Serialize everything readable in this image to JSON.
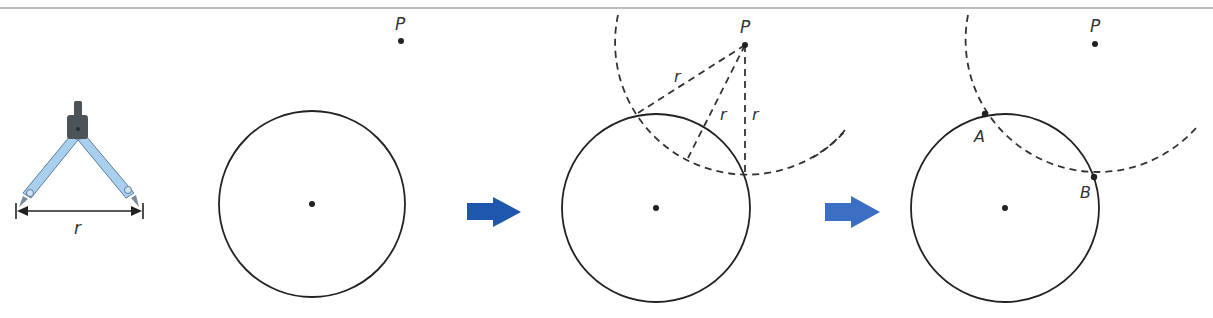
{
  "diagram": {
    "colors": {
      "border": "#a9a9a9",
      "stroke": "#222222",
      "dashed": "#333333",
      "arrow_step1": "#1e57ad",
      "arrow_step2": "#3b6fc4",
      "compass_leg": "#a9cfee",
      "compass_leg_edge": "#5c7e9c",
      "compass_head": "#4d5459"
    },
    "compass": {
      "label": "r",
      "description": "compass opened to radius r"
    },
    "panels": [
      {
        "step": 1,
        "point_label": "P",
        "circle": {
          "cx": 312,
          "cy": 204,
          "r": 93
        },
        "point": {
          "x": 401,
          "y": 41
        }
      },
      {
        "step": 2,
        "point_label": "P",
        "circle": {
          "cx": 656,
          "cy": 208,
          "r": 94
        },
        "point": {
          "x": 745,
          "y": 45
        },
        "arc_radius": 132,
        "radius_labels": [
          "r",
          "r",
          "r"
        ]
      },
      {
        "step": 3,
        "point_label": "P",
        "circle": {
          "cx": 1005,
          "cy": 208,
          "r": 94
        },
        "point": {
          "x": 1095,
          "y": 44
        },
        "arc_radius": 132,
        "intersection_labels": [
          "A",
          "B"
        ]
      }
    ],
    "arrows": [
      {
        "name": "step-arrow-1",
        "direction": "right"
      },
      {
        "name": "step-arrow-2",
        "direction": "right"
      }
    ]
  }
}
